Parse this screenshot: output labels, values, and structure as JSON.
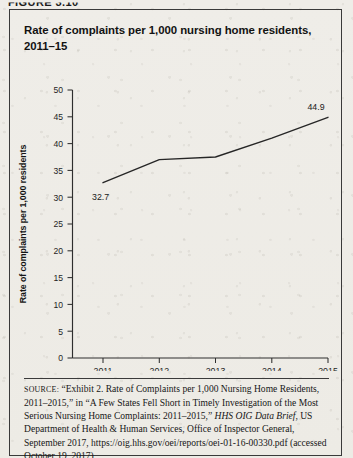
{
  "figure_label": "FIGURE 3.10",
  "title": "Rate of complaints per 1,000 nursing home residents, 2011–15",
  "axes": {
    "ylabel": "Rate of complaints per 1,000 residents",
    "yticks": [
      "0",
      "5",
      "10",
      "15",
      "20",
      "25",
      "30",
      "35",
      "40",
      "45",
      "50"
    ],
    "xticks": [
      "2011",
      "2012",
      "2013",
      "2014",
      "2015"
    ]
  },
  "point_labels": {
    "first": "32.7",
    "last": "44.9"
  },
  "source": {
    "prefix": "SOURCE:",
    "part1": " “Exhibit 2. Rate of Complaints per 1,000 Nursing Home Residents, 2011–2015,” in “A Few States Fell Short in Timely Investigation of the Most Serious Nursing Home Complaints: 2011–2015,” ",
    "italic": "HHS OIG Data Brief",
    "part2": ", US Department of Health & Human Services, Office of Inspector General, September 2017, https://oig.hhs.gov/oei/reports/oei-01-16-00330.pdf (accessed October 19, 2017)"
  },
  "colors": {
    "line": "#262626",
    "axis": "#2e2e2e",
    "border": "#3a3a3a",
    "paper": "#eeece7"
  },
  "chart_data": {
    "type": "line",
    "title": "Rate of complaints per 1,000 nursing home residents, 2011–15",
    "xlabel": "",
    "ylabel": "Rate of complaints per 1,000 residents",
    "categories": [
      "2011",
      "2012",
      "2013",
      "2014",
      "2015"
    ],
    "x": [
      2011,
      2012,
      2013,
      2014,
      2015
    ],
    "values": [
      32.7,
      37.0,
      37.5,
      41.0,
      44.9
    ],
    "series": [
      {
        "name": "Rate of complaints per 1,000 residents",
        "values": [
          32.7,
          37.0,
          37.5,
          41.0,
          44.9
        ]
      }
    ],
    "data_labels": {
      "2011": "32.7",
      "2015": "44.9"
    },
    "ylim": [
      0,
      50
    ],
    "ytick_step": 5,
    "grid": false,
    "legend": false
  }
}
